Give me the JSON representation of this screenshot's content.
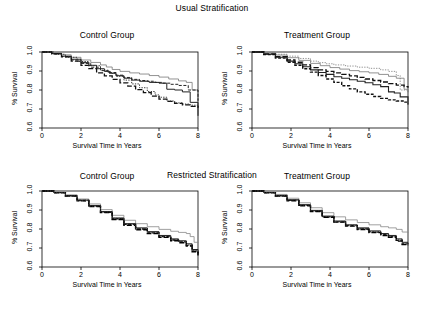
{
  "figure": {
    "rows": [
      {
        "id": "usual",
        "title": "Usual Stratification"
      },
      {
        "id": "restricted",
        "title": "Restricted Stratification"
      }
    ]
  },
  "axes": {
    "xlabel": "Survival Time in Years",
    "ylabel": "% Survival",
    "xticks": [
      "0",
      "2",
      "4",
      "6",
      "8"
    ],
    "yticks": [
      "0.6",
      "0.7",
      "0.8",
      "0.9",
      "1.0"
    ]
  },
  "chart_data": [
    {
      "id": "usual-control",
      "type": "line",
      "title": "Control Group",
      "subtitle": "Usual Stratification",
      "xlabel": "Survival Time in Years",
      "ylabel": "% Survival",
      "xlim": [
        0,
        8
      ],
      "ylim": [
        0.6,
        1.0
      ],
      "xticks": [
        0,
        2,
        4,
        6,
        8
      ],
      "yticks": [
        0.6,
        0.7,
        0.8,
        0.9,
        1.0
      ],
      "grid": false,
      "legend": "none",
      "step": "post",
      "series": [
        {
          "name": "stratum-1",
          "style": "solid",
          "color": "#777777",
          "width": 0.8,
          "x": [
            0,
            0.5,
            1.0,
            1.5,
            2.0,
            2.5,
            3.0,
            3.3,
            3.6,
            4.0,
            4.5,
            5.0,
            5.5,
            6.0,
            6.5,
            7.0,
            7.4,
            7.7,
            8.0
          ],
          "y": [
            1.0,
            0.995,
            0.985,
            0.972,
            0.958,
            0.945,
            0.932,
            0.921,
            0.908,
            0.898,
            0.89,
            0.884,
            0.876,
            0.868,
            0.858,
            0.848,
            0.84,
            0.8,
            0.742
          ]
        },
        {
          "name": "stratum-2",
          "style": "solid",
          "color": "#222222",
          "width": 1.0,
          "x": [
            0,
            0.5,
            1.0,
            1.5,
            2.0,
            2.4,
            2.8,
            3.2,
            3.5,
            3.8,
            4.2,
            4.6,
            5.0,
            5.5,
            6.0,
            6.4,
            6.8,
            7.2,
            7.6,
            8.0
          ],
          "y": [
            1.0,
            0.992,
            0.978,
            0.962,
            0.944,
            0.93,
            0.912,
            0.898,
            0.888,
            0.875,
            0.862,
            0.852,
            0.846,
            0.84,
            0.836,
            0.804,
            0.8,
            0.79,
            0.735,
            0.664
          ]
        },
        {
          "name": "stratum-3",
          "style": "dashed",
          "color": "#222222",
          "width": 1.0,
          "x": [
            0,
            0.5,
            1.0,
            1.5,
            2.0,
            2.5,
            3.0,
            3.4,
            3.8,
            4.2,
            4.6,
            5.0,
            5.4,
            5.8,
            6.2,
            6.6,
            7.0,
            7.5,
            8.0
          ],
          "y": [
            1.0,
            0.99,
            0.976,
            0.958,
            0.94,
            0.92,
            0.902,
            0.892,
            0.878,
            0.866,
            0.856,
            0.85,
            0.846,
            0.84,
            0.836,
            0.83,
            0.824,
            0.8,
            0.744
          ]
        },
        {
          "name": "stratum-4",
          "style": "long-dash",
          "color": "#111111",
          "width": 1.3,
          "x": [
            0,
            0.5,
            1.0,
            1.5,
            2.0,
            2.4,
            2.8,
            3.2,
            3.6,
            4.0,
            4.4,
            4.8,
            5.2,
            5.6,
            6.0,
            6.4,
            6.8,
            7.2,
            7.6,
            8.0
          ],
          "y": [
            1.0,
            0.99,
            0.974,
            0.952,
            0.93,
            0.912,
            0.89,
            0.874,
            0.856,
            0.838,
            0.82,
            0.802,
            0.786,
            0.768,
            0.752,
            0.74,
            0.73,
            0.722,
            0.714,
            0.706
          ]
        },
        {
          "name": "stratum-5",
          "style": "dotted",
          "color": "#333333",
          "width": 1.0,
          "x": [
            0,
            0.6,
            1.2,
            1.8,
            2.4,
            3.0,
            3.4,
            3.8,
            4.2,
            4.6,
            5.0,
            5.4,
            5.8,
            6.0,
            6.4,
            6.8,
            7.2,
            7.6,
            8.0
          ],
          "y": [
            1.0,
            0.988,
            0.972,
            0.95,
            0.928,
            0.904,
            0.888,
            0.872,
            0.852,
            0.832,
            0.812,
            0.792,
            0.774,
            0.762,
            0.742,
            0.732,
            0.726,
            0.72,
            0.714
          ]
        }
      ]
    },
    {
      "id": "usual-treatment",
      "type": "line",
      "title": "Treatment Group",
      "subtitle": "Usual Stratification",
      "xlabel": "Survival Time in Years",
      "ylabel": "% Survival",
      "xlim": [
        0,
        8
      ],
      "ylim": [
        0.6,
        1.0
      ],
      "xticks": [
        0,
        2,
        4,
        6,
        8
      ],
      "yticks": [
        0.6,
        0.7,
        0.8,
        0.9,
        1.0
      ],
      "grid": false,
      "legend": "none",
      "step": "post",
      "series": [
        {
          "name": "stratum-1",
          "style": "dotted",
          "color": "#888888",
          "width": 0.9,
          "x": [
            0,
            0.6,
            1.2,
            1.8,
            2.4,
            3.0,
            3.4,
            3.8,
            4.2,
            4.8,
            5.4,
            6.0,
            6.6,
            7.0,
            7.4,
            7.6,
            8.0
          ],
          "y": [
            1.0,
            0.996,
            0.988,
            0.978,
            0.966,
            0.952,
            0.944,
            0.938,
            0.932,
            0.926,
            0.92,
            0.914,
            0.906,
            0.898,
            0.876,
            0.8,
            0.79
          ]
        },
        {
          "name": "stratum-2",
          "style": "solid",
          "color": "#777777",
          "width": 0.8,
          "x": [
            0,
            0.6,
            1.2,
            1.8,
            2.4,
            3.0,
            3.5,
            4.0,
            4.5,
            5.0,
            5.5,
            6.0,
            6.5,
            7.0,
            7.4,
            7.8,
            8.0
          ],
          "y": [
            1.0,
            0.994,
            0.984,
            0.97,
            0.956,
            0.94,
            0.928,
            0.918,
            0.91,
            0.902,
            0.896,
            0.89,
            0.882,
            0.872,
            0.862,
            0.804,
            0.788
          ]
        },
        {
          "name": "stratum-3",
          "style": "long-dash",
          "color": "#111111",
          "width": 1.3,
          "x": [
            0,
            0.6,
            1.2,
            1.8,
            2.2,
            2.6,
            3.0,
            3.4,
            3.8,
            4.2,
            4.6,
            5.0,
            5.4,
            5.8,
            6.2,
            6.6,
            7.0,
            7.4,
            7.8,
            8.0
          ],
          "y": [
            1.0,
            0.99,
            0.976,
            0.958,
            0.946,
            0.932,
            0.918,
            0.906,
            0.898,
            0.89,
            0.882,
            0.874,
            0.866,
            0.858,
            0.85,
            0.842,
            0.834,
            0.826,
            0.818,
            0.812
          ]
        },
        {
          "name": "stratum-4",
          "style": "solid",
          "color": "#222222",
          "width": 1.1,
          "x": [
            0,
            0.6,
            1.2,
            1.8,
            2.2,
            2.6,
            3.0,
            3.4,
            3.8,
            4.2,
            4.6,
            5.0,
            5.4,
            5.8,
            6.2,
            6.6,
            7.0,
            7.3,
            7.6,
            8.0
          ],
          "y": [
            1.0,
            0.988,
            0.972,
            0.952,
            0.938,
            0.922,
            0.906,
            0.892,
            0.882,
            0.87,
            0.862,
            0.854,
            0.846,
            0.838,
            0.828,
            0.818,
            0.79,
            0.784,
            0.764,
            0.722
          ]
        },
        {
          "name": "stratum-5",
          "style": "dashed",
          "color": "#111111",
          "width": 1.4,
          "x": [
            0,
            0.6,
            1.2,
            1.8,
            2.2,
            2.6,
            3.0,
            3.4,
            3.8,
            4.2,
            4.6,
            5.0,
            5.4,
            5.8,
            6.2,
            6.6,
            7.0,
            7.4,
            7.8,
            8.0
          ],
          "y": [
            1.0,
            0.986,
            0.968,
            0.946,
            0.93,
            0.912,
            0.894,
            0.876,
            0.858,
            0.84,
            0.822,
            0.806,
            0.79,
            0.778,
            0.766,
            0.756,
            0.748,
            0.742,
            0.736,
            0.73
          ]
        }
      ]
    },
    {
      "id": "restricted-control",
      "type": "line",
      "title": "Control Group",
      "subtitle": "Restricted Stratification",
      "xlabel": "Survival Time in Years",
      "ylabel": "% Survival",
      "xlim": [
        0,
        8
      ],
      "ylim": [
        0.6,
        1.0
      ],
      "xticks": [
        0,
        2,
        4,
        6,
        8
      ],
      "yticks": [
        0.6,
        0.7,
        0.8,
        0.9,
        1.0
      ],
      "grid": false,
      "legend": "none",
      "step": "post",
      "series": [
        {
          "name": "stratum-1",
          "style": "solid",
          "color": "#888888",
          "width": 0.8,
          "x": [
            0,
            0.6,
            1.2,
            1.8,
            2.4,
            3.0,
            3.6,
            4.2,
            4.8,
            5.4,
            6.0,
            6.6,
            7.0,
            7.4,
            7.6,
            7.8,
            8.0
          ],
          "y": [
            1.0,
            0.994,
            0.98,
            0.958,
            0.932,
            0.902,
            0.872,
            0.846,
            0.828,
            0.812,
            0.798,
            0.788,
            0.782,
            0.776,
            0.76,
            0.73,
            0.726
          ]
        },
        {
          "name": "stratum-2",
          "style": "solid",
          "color": "#222222",
          "width": 1.0,
          "x": [
            0,
            0.6,
            1.2,
            1.8,
            2.4,
            3.0,
            3.6,
            4.2,
            4.8,
            5.4,
            6.0,
            6.6,
            7.0,
            7.4,
            7.7,
            8.0
          ],
          "y": [
            1.0,
            0.992,
            0.976,
            0.952,
            0.924,
            0.892,
            0.858,
            0.828,
            0.806,
            0.786,
            0.766,
            0.748,
            0.738,
            0.722,
            0.692,
            0.674
          ]
        },
        {
          "name": "stratum-3",
          "style": "dashed",
          "color": "#111111",
          "width": 1.3,
          "x": [
            0,
            0.6,
            1.2,
            1.8,
            2.4,
            3.0,
            3.6,
            4.2,
            4.8,
            5.4,
            6.0,
            6.6,
            7.0,
            7.4,
            7.7,
            8.0
          ],
          "y": [
            1.0,
            0.991,
            0.974,
            0.95,
            0.92,
            0.888,
            0.854,
            0.824,
            0.8,
            0.78,
            0.76,
            0.742,
            0.732,
            0.714,
            0.684,
            0.664
          ]
        },
        {
          "name": "stratum-4",
          "style": "long-dash",
          "color": "#000000",
          "width": 1.4,
          "x": [
            0,
            0.6,
            1.2,
            1.8,
            2.4,
            3.0,
            3.6,
            4.2,
            4.8,
            5.4,
            6.0,
            6.6,
            7.0,
            7.4,
            7.7,
            8.0
          ],
          "y": [
            1.0,
            0.99,
            0.973,
            0.948,
            0.918,
            0.886,
            0.85,
            0.82,
            0.796,
            0.776,
            0.756,
            0.738,
            0.728,
            0.71,
            0.68,
            0.66
          ]
        },
        {
          "name": "stratum-5",
          "style": "dotted",
          "color": "#333333",
          "width": 1.0,
          "x": [
            0,
            0.6,
            1.2,
            1.8,
            2.4,
            3.0,
            3.6,
            4.2,
            4.8,
            5.4,
            6.0,
            6.6,
            7.0,
            7.4,
            7.7,
            8.0
          ],
          "y": [
            1.0,
            0.992,
            0.975,
            0.951,
            0.921,
            0.89,
            0.856,
            0.826,
            0.802,
            0.782,
            0.762,
            0.744,
            0.734,
            0.716,
            0.686,
            0.668
          ]
        }
      ]
    },
    {
      "id": "restricted-treatment",
      "type": "line",
      "title": "Treatment Group",
      "subtitle": "Restricted Stratification",
      "xlabel": "Survival Time in Years",
      "ylabel": "% Survival",
      "xlim": [
        0,
        8
      ],
      "ylim": [
        0.6,
        1.0
      ],
      "xticks": [
        0,
        2,
        4,
        6,
        8
      ],
      "yticks": [
        0.6,
        0.7,
        0.8,
        0.9,
        1.0
      ],
      "grid": false,
      "legend": "none",
      "step": "post",
      "series": [
        {
          "name": "stratum-1",
          "style": "solid",
          "color": "#888888",
          "width": 0.8,
          "x": [
            0,
            0.6,
            1.2,
            1.8,
            2.4,
            3.0,
            3.6,
            4.2,
            4.8,
            5.4,
            6.0,
            6.6,
            7.0,
            7.4,
            7.7,
            8.0
          ],
          "y": [
            1.0,
            0.994,
            0.982,
            0.962,
            0.938,
            0.912,
            0.886,
            0.864,
            0.848,
            0.834,
            0.822,
            0.812,
            0.806,
            0.798,
            0.784,
            0.78
          ]
        },
        {
          "name": "stratum-2",
          "style": "solid",
          "color": "#222222",
          "width": 1.0,
          "x": [
            0,
            0.6,
            1.2,
            1.8,
            2.4,
            3.0,
            3.6,
            4.2,
            4.8,
            5.4,
            6.0,
            6.6,
            7.0,
            7.4,
            7.7,
            8.0
          ],
          "y": [
            1.0,
            0.992,
            0.977,
            0.954,
            0.928,
            0.898,
            0.868,
            0.842,
            0.822,
            0.806,
            0.79,
            0.776,
            0.766,
            0.748,
            0.73,
            0.728
          ]
        },
        {
          "name": "stratum-3",
          "style": "dashed",
          "color": "#111111",
          "width": 1.3,
          "x": [
            0,
            0.6,
            1.2,
            1.8,
            2.4,
            3.0,
            3.6,
            4.2,
            4.8,
            5.4,
            6.0,
            6.6,
            7.0,
            7.4,
            7.7,
            8.0
          ],
          "y": [
            1.0,
            0.991,
            0.975,
            0.951,
            0.924,
            0.894,
            0.864,
            0.838,
            0.818,
            0.8,
            0.784,
            0.77,
            0.76,
            0.74,
            0.722,
            0.718
          ]
        },
        {
          "name": "stratum-4",
          "style": "long-dash",
          "color": "#000000",
          "width": 1.4,
          "x": [
            0,
            0.6,
            1.2,
            1.8,
            2.4,
            3.0,
            3.6,
            4.2,
            4.8,
            5.4,
            6.0,
            6.6,
            7.0,
            7.4,
            7.7,
            8.0
          ],
          "y": [
            1.0,
            0.99,
            0.974,
            0.949,
            0.922,
            0.892,
            0.862,
            0.836,
            0.815,
            0.797,
            0.781,
            0.766,
            0.756,
            0.736,
            0.718,
            0.714
          ]
        },
        {
          "name": "stratum-5",
          "style": "dotted",
          "color": "#333333",
          "width": 1.0,
          "x": [
            0,
            0.6,
            1.2,
            1.8,
            2.4,
            3.0,
            3.6,
            4.2,
            4.8,
            5.4,
            6.0,
            6.6,
            7.0,
            7.4,
            7.7,
            8.0
          ],
          "y": [
            1.0,
            0.992,
            0.976,
            0.952,
            0.926,
            0.896,
            0.866,
            0.84,
            0.82,
            0.802,
            0.786,
            0.772,
            0.762,
            0.743,
            0.725,
            0.722
          ]
        }
      ]
    }
  ]
}
